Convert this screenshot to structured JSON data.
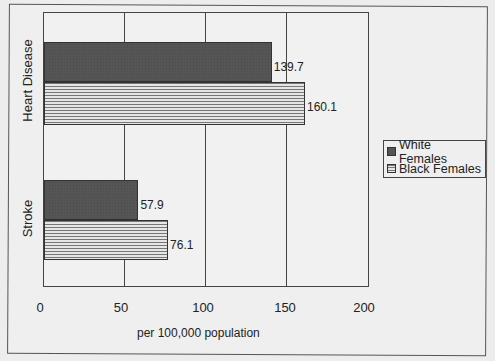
{
  "chart_data": {
    "type": "bar",
    "orientation": "horizontal",
    "title": "",
    "categories": [
      "Heart Disease",
      "Stroke"
    ],
    "series": [
      {
        "name": "White Females",
        "values": [
          139.7,
          57.9
        ],
        "pattern": "dark-stipple",
        "color": "#555555"
      },
      {
        "name": "Black Females",
        "values": [
          160.1,
          76.1
        ],
        "pattern": "horizontal-lines",
        "color": "#e4e4e4"
      }
    ],
    "xlabel": "per 100,000 population",
    "ylabel": "",
    "xlim": [
      0,
      200
    ],
    "xticks": [
      0,
      50,
      100,
      150,
      200
    ],
    "grid": "vertical",
    "legend_position": "right"
  },
  "labels": {
    "heart_white": "139.7",
    "heart_black": "160.1",
    "stroke_white": "57.9",
    "stroke_black": "76.1",
    "cat_heart": "Heart Disease",
    "cat_stroke": "Stroke",
    "tick0": "0",
    "tick50": "50",
    "tick100": "100",
    "tick150": "150",
    "tick200": "200",
    "xlabel": "per 100,000 population",
    "legend_white": "White Females",
    "legend_black": "Black Females"
  }
}
